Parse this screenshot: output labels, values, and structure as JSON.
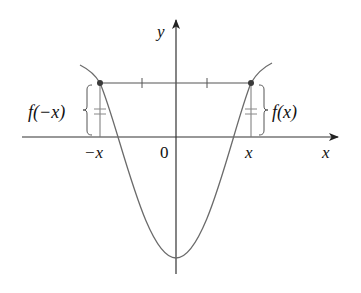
{
  "diagram": {
    "axes": {
      "x_label": "x",
      "y_label": "y",
      "origin_label": "0"
    },
    "points": {
      "left_tick_label": "−x",
      "right_tick_label": "x"
    },
    "annotations": {
      "left_value_label": "f(−x)",
      "right_value_label": "f(x)"
    },
    "colors": {
      "axis": "#222222",
      "curve": "#6b6b6b",
      "point": "#3a3a3a"
    }
  }
}
